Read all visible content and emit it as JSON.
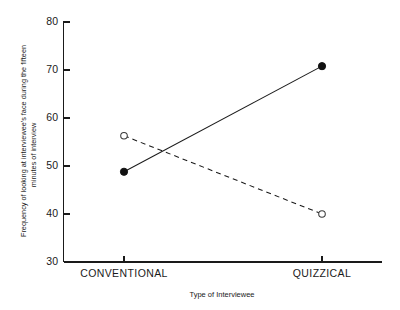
{
  "chart_data": {
    "type": "line",
    "title": "",
    "xlabel": "Type of Interviewee",
    "ylabel": "Frequency of looking at interviewee's face during the fifteen minutes of interview",
    "ylabel_line1": "Frequency of looking at interviewee's face during the fifteen",
    "ylabel_line2": "minutes of interview",
    "categories": [
      "CONVENTIONAL",
      "QUIZZICAL"
    ],
    "x": [
      0,
      1
    ],
    "ylim": [
      30,
      80
    ],
    "yticks": [
      30,
      40,
      50,
      60,
      70,
      80
    ],
    "ytick_labels": [
      "30",
      "40",
      "50",
      "60",
      "70",
      "80"
    ],
    "xtick_labels": [
      "CONVENTIONAL",
      "QUIZZICAL"
    ],
    "grid": false,
    "legend": "none",
    "series": [
      {
        "name": "solid-filled-circle",
        "marker": "filled-circle",
        "linestyle": "solid",
        "color": "#111111",
        "values": [
          48.8,
          70.8
        ]
      },
      {
        "name": "dashed-open-circle",
        "marker": "open-circle",
        "linestyle": "dashed",
        "color": "#3a3a3a",
        "values": [
          56.3,
          40.0
        ]
      }
    ]
  },
  "axes": {
    "y_tick_0": "30",
    "y_tick_1": "40",
    "y_tick_2": "50",
    "y_tick_3": "60",
    "y_tick_4": "70",
    "y_tick_5": "80",
    "x_tick_0": "CONVENTIONAL",
    "x_tick_1": "QUIZZICAL",
    "x_axis_title": "Type of Interviewee",
    "y_axis_title_line1": "Frequency of looking at interviewee's face during the fifteen",
    "y_axis_title_line2": "minutes of interview"
  }
}
